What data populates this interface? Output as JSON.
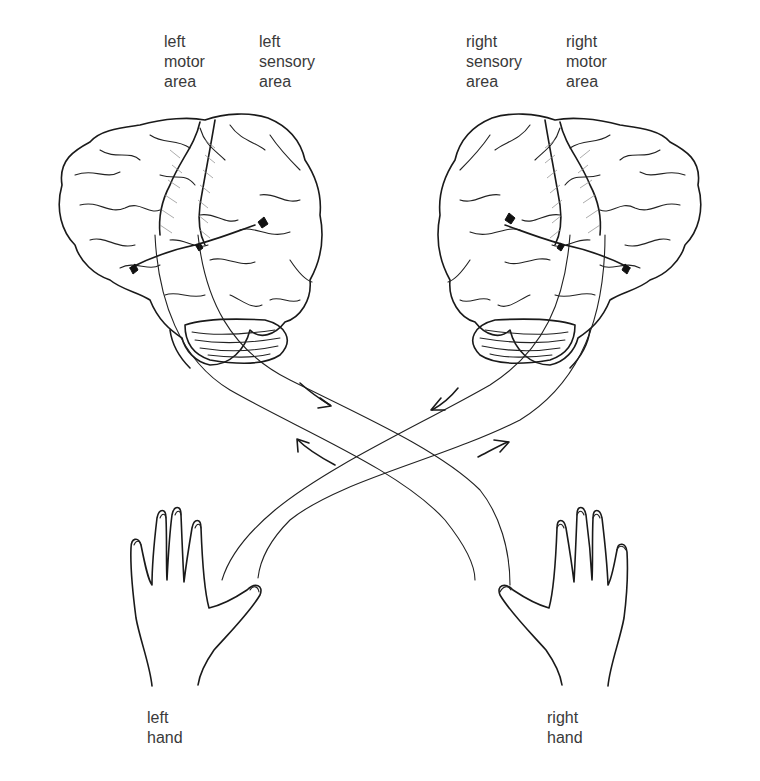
{
  "labels": {
    "left_motor_area": [
      "left",
      "motor",
      "area"
    ],
    "left_sensory_area": [
      "left",
      "sensory",
      "area"
    ],
    "right_sensory_area": [
      "right",
      "sensory",
      "area"
    ],
    "right_motor_area": [
      "right",
      "motor",
      "area"
    ],
    "left_hand": [
      "left",
      "hand"
    ],
    "right_hand": [
      "right",
      "hand"
    ]
  },
  "figure": {
    "elements": [
      "left-brain",
      "right-brain",
      "crossing-pathways",
      "direction-arrows",
      "left-hand",
      "right-hand"
    ],
    "arrows": [
      {
        "position": "upper-left",
        "direction": "down-right"
      },
      {
        "position": "upper-right",
        "direction": "down-left"
      },
      {
        "position": "lower-left",
        "direction": "up-left"
      },
      {
        "position": "lower-right",
        "direction": "up-right"
      }
    ],
    "colors": {
      "ink": "#1a1a1a",
      "text": "#3a3a3a",
      "hatch": "#888888",
      "background": "#ffffff"
    }
  }
}
